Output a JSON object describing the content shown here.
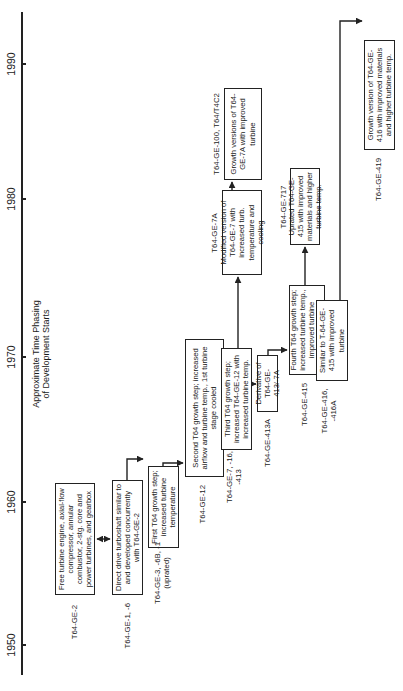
{
  "diagram": {
    "title_line1": "Approximate Time Phasing",
    "title_line2": "of Development Starts",
    "axis": {
      "orientation": "rotated -90deg (years increase upward on page)",
      "ticks": [
        "1950",
        "1960",
        "1970",
        "1980",
        "1990"
      ]
    },
    "nodes": [
      {
        "id": "ge2",
        "model": "T64-GE-2",
        "description": "Free turbine engine, axial-flow compressor, annular combustor, 2-stg. core and power turbines, and gearbox"
      },
      {
        "id": "ge1",
        "model": "T64-GE-1, -6",
        "description": "Direct drive turboshaft similar to and developed concurrently with T64-GE-2"
      },
      {
        "id": "ge3",
        "model": "T64-GE-3, -6B, -1 (uprated)",
        "description": "First T64 growth step; increased turbine temperature"
      },
      {
        "id": "ge12",
        "model": "T64-GE-12",
        "description": "Second T64 growth step; increased airflow and turbine temp., 1st turbine stage cooled"
      },
      {
        "id": "ge7",
        "model": "T64-GE-7, -16, -413",
        "description": "Third T64 growth step; increased T64-GE-12 with increased turbine temp."
      },
      {
        "id": "ge413a",
        "model": "T64-GE-413A",
        "description": "Derivative of T64-GE-413/-7A"
      },
      {
        "id": "ge7a",
        "model": "T64-GE-7A",
        "description": "Modified version of T64-GE-7 with increased turb. temperature and cooling"
      },
      {
        "id": "ge100",
        "model": "T64-GE-100, T64/T4C2",
        "description": "Growth versions of T64-GE-7A with improved turbine"
      },
      {
        "id": "ge415",
        "model": "T64-GE-415",
        "description": "Fourth T64 growth step; increased turbine temp., improved turbine cooling"
      },
      {
        "id": "ge717",
        "model": "T64-GE-717",
        "description": "Uprated T64-GE-415 with improved materials and higher turbine temp."
      },
      {
        "id": "ge416",
        "model": "T64-GE-416, -416A",
        "description": "Similar to T-64-GE-415 with improved turbine"
      },
      {
        "id": "ge419",
        "model": "T64-GE-419",
        "description": "Growth version of T64-GE-416 with improved materials and higher turbine temp."
      }
    ],
    "edges": [
      {
        "from": "ge2",
        "to": "ge1",
        "type": "bidirectional"
      },
      {
        "from": "ge1",
        "to": "ge3"
      },
      {
        "from": "ge3",
        "to": "ge12"
      },
      {
        "from": "ge12",
        "to": "ge7"
      },
      {
        "from": "ge7",
        "to": "ge7a"
      },
      {
        "from": "ge7",
        "to": "ge413a"
      },
      {
        "from": "ge7a",
        "to": "ge100"
      },
      {
        "from": "ge413a",
        "to": "ge415"
      },
      {
        "from": "ge415",
        "to": "ge717"
      },
      {
        "from": "ge415",
        "to": "ge416"
      },
      {
        "from": "ge416",
        "to": "ge419"
      }
    ]
  }
}
